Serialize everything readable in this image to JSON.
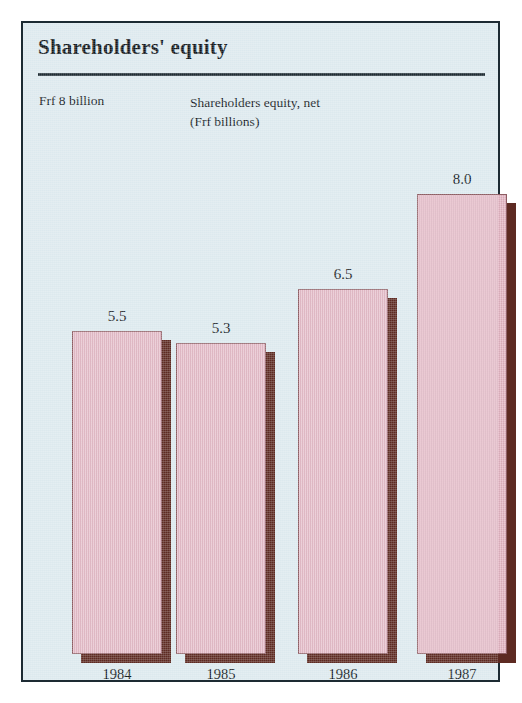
{
  "figure": {
    "title": "Shareholders' equity",
    "axis_caption": "Frf 8 billion",
    "series_caption_line1": "Shareholders equity, net",
    "series_caption_line2": "(Frf billions)",
    "panel_background": "#dce9ee",
    "frame_color": "#1d2b33",
    "bar_color": "#e2b2c1",
    "bar_shadow_color": "#5d2a22",
    "text_color": "#10161b"
  },
  "chart_data": {
    "type": "bar",
    "title": "Shareholders' equity",
    "subtitle": "Shareholders equity, net (Frf billions)",
    "xlabel": "",
    "ylabel": "Frf 8 billion",
    "categories": [
      "1984",
      "1985",
      "1986",
      "1987"
    ],
    "values": [
      5.5,
      5.3,
      6.5,
      8.0
    ],
    "value_labels": [
      "5.5",
      "5.3",
      "6.5",
      "8.0"
    ],
    "ylim": [
      0,
      8
    ],
    "grid": false,
    "legend": false,
    "units": "Frf billions"
  },
  "bars": [
    {
      "label": "1984",
      "value_label": "5.5",
      "left": 49,
      "width": 90,
      "height": 323
    },
    {
      "label": "1985",
      "value_label": "5.3",
      "left": 153,
      "width": 90,
      "height": 311
    },
    {
      "label": "1986",
      "value_label": "6.5",
      "left": 275,
      "width": 90,
      "height": 365
    },
    {
      "label": "1987",
      "value_label": "8.0",
      "left": 394,
      "width": 90,
      "height": 460
    }
  ]
}
